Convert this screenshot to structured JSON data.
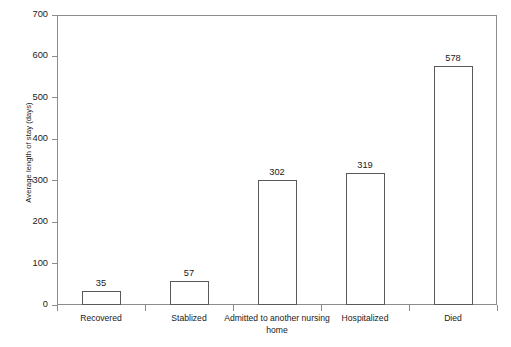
{
  "chart_data": {
    "type": "bar",
    "title": "",
    "xlabel": "",
    "ylabel": "Average length of stay (days)",
    "categories": [
      "Recovered",
      "Stablized",
      "Admitted to another nursing home",
      "Hospitalized",
      "Died"
    ],
    "values": [
      35,
      57,
      302,
      319,
      578
    ],
    "value_labels": [
      "35",
      "57",
      "302",
      "319",
      "578"
    ],
    "ylim": [
      0,
      700
    ],
    "ytick_labels": [
      "0",
      "100",
      "200",
      "300",
      "400",
      "500",
      "600",
      "700"
    ],
    "ytick_values": [
      0,
      100,
      200,
      300,
      400,
      500,
      600,
      700
    ],
    "grid": false,
    "legend": false,
    "colors": {
      "bar_fill": "#ffffff",
      "bar_edge": "#595959",
      "axis": "#8c8c8c",
      "text": "#1a1a1a",
      "background": "#ffffff"
    }
  }
}
